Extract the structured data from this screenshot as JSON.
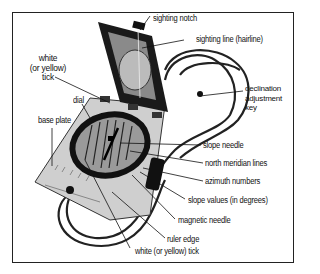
{
  "diagram": {
    "labels": {
      "sighting_notch": "sighting notch",
      "sighting_line": "sighting line (hairline)",
      "white_tick_top_1": "white",
      "white_tick_top_2": "(or yellow)",
      "white_tick_top_3": "tick",
      "dial": "dial",
      "base_plate": "base plate",
      "declination_1": "declination",
      "declination_2": "adjustment",
      "declination_3": "key",
      "slope_needle": "slope needle",
      "north_meridian_lines": "north meridian lines",
      "azimuth_numbers": "azimuth numbers",
      "slope_values": "slope values (in degrees)",
      "magnetic_needle": "magnetic needle",
      "ruler_edge": "ruler edge",
      "white_tick_bottom": "white (or yellow) tick"
    }
  }
}
